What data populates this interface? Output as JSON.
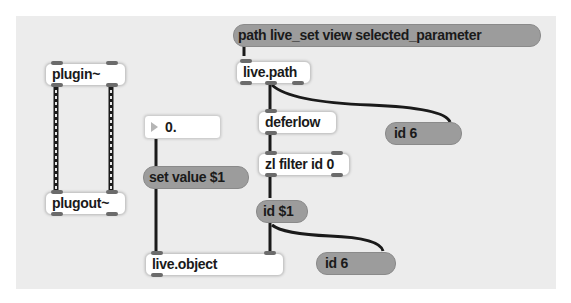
{
  "patcher": {
    "objects": [
      {
        "id": "plugin",
        "type": "object",
        "label": "plugin~"
      },
      {
        "id": "plugout",
        "type": "object",
        "label": "plugout~"
      },
      {
        "id": "number",
        "type": "flonum",
        "label": "0."
      },
      {
        "id": "setvalue",
        "type": "message",
        "label": "set value $1"
      },
      {
        "id": "liveobject",
        "type": "object",
        "label": "live.object"
      },
      {
        "id": "pathmsg",
        "type": "message",
        "label": "path live_set view selected_parameter"
      },
      {
        "id": "livepath",
        "type": "object",
        "label": "live.path"
      },
      {
        "id": "deferlow",
        "type": "object",
        "label": "deferlow"
      },
      {
        "id": "id6a",
        "type": "message",
        "label": "id 6"
      },
      {
        "id": "zlfilter",
        "type": "object",
        "label": "zl filter id 0"
      },
      {
        "id": "iddollar",
        "type": "message",
        "label": "id $1"
      },
      {
        "id": "id6b",
        "type": "message",
        "label": "id 6"
      }
    ],
    "connections": [
      {
        "from": "plugin:0",
        "to": "plugout:0",
        "kind": "signal"
      },
      {
        "from": "plugin:1",
        "to": "plugout:1",
        "kind": "signal"
      },
      {
        "from": "number:0",
        "to": "liveobject:0",
        "kind": "control"
      },
      {
        "from": "pathmsg:0",
        "to": "livepath:0",
        "kind": "control"
      },
      {
        "from": "livepath:1",
        "to": "deferlow:0",
        "kind": "control"
      },
      {
        "from": "livepath:1",
        "to": "id6a:0",
        "kind": "control"
      },
      {
        "from": "deferlow:0",
        "to": "zlfilter:0",
        "kind": "control"
      },
      {
        "from": "zlfilter:0",
        "to": "iddollar:0",
        "kind": "control"
      },
      {
        "from": "iddollar:0",
        "to": "liveobject:1",
        "kind": "control"
      },
      {
        "from": "iddollar:0",
        "to": "id6b:0",
        "kind": "control"
      }
    ]
  },
  "colors": {
    "canvas": "#ececec",
    "object_bg": "#ffffff",
    "message_bg": "#9c9c9c",
    "patch_cord": "#1a1a1a",
    "port": "#6b6b6b"
  }
}
